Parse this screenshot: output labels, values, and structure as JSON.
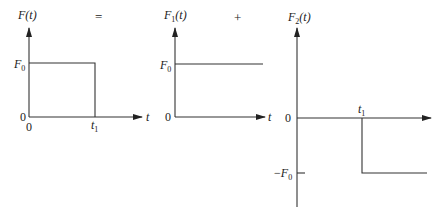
{
  "diagram": {
    "operators": {
      "equals": "=",
      "plus": "+"
    },
    "graphs": [
      {
        "id": "F",
        "title_main": "F",
        "title_sub": "",
        "title_arg": "(t)",
        "x_label": "t",
        "y_ticks": {
          "top": "F",
          "top_sub": "0",
          "origin": "0"
        },
        "x_ticks": {
          "origin": "0",
          "t1_main": "t",
          "t1_sub": "1"
        },
        "shape": "rectangular pulse from 0 to t1 with height F0"
      },
      {
        "id": "F1",
        "title_main": "F",
        "title_sub": "1",
        "title_arg": "(t)",
        "x_label": "t",
        "y_ticks": {
          "top": "F",
          "top_sub": "0",
          "origin": "0"
        },
        "shape": "constant step of height F0 for t >= 0"
      },
      {
        "id": "F2",
        "title_main": "F",
        "title_sub": "2",
        "title_arg": "(t)",
        "x_label": "",
        "y_ticks": {
          "origin": "0",
          "bottom_sign": "−",
          "bottom": "F",
          "bottom_sub": "0"
        },
        "x_ticks": {
          "t1_main": "t",
          "t1_sub": "1"
        },
        "shape": "step of height -F0 starting at t1"
      }
    ],
    "colors": {
      "line": "#333333",
      "text": "#222222",
      "background": "#ffffff"
    }
  }
}
